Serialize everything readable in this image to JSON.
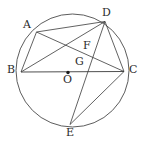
{
  "figure": {
    "name": "circle-with-inscribed-chords",
    "width": 147,
    "height": 146,
    "background_color": "#ffffff",
    "stroke_color": "#3a3a3a",
    "label_color": "#2b2b2b"
  },
  "circle": {
    "label": "circle-O",
    "center": {
      "x": 72.5,
      "y": 70.5
    },
    "radius": 56.5,
    "stroke_color": "#4a4a4a",
    "stroke_width": 0.9
  },
  "center_point": {
    "label": "O",
    "x": 68.0,
    "y": 72.5,
    "dot_radius": 1.7,
    "label_x": 63,
    "label_y": 74
  },
  "points": [
    {
      "id": "A",
      "label": "A",
      "x": 36.5,
      "y": 32.0,
      "label_x": 23,
      "label_y": 19,
      "on_circle": true
    },
    {
      "id": "B",
      "label": "B",
      "x": 21.0,
      "y": 72.0,
      "label_x": 7,
      "label_y": 64,
      "on_circle": true
    },
    {
      "id": "C",
      "label": "C",
      "x": 124.0,
      "y": 71.5,
      "label_x": 129,
      "label_y": 64,
      "on_circle": true
    },
    {
      "id": "D",
      "label": "D",
      "x": 105.0,
      "y": 21.5,
      "label_x": 102,
      "label_y": 7,
      "on_circle": true
    },
    {
      "id": "E",
      "label": "E",
      "x": 70.0,
      "y": 124.5,
      "label_x": 66,
      "label_y": 127,
      "on_circle": true
    },
    {
      "id": "F",
      "label": "F",
      "x": 82.0,
      "y": 51.5,
      "label_x": 83,
      "label_y": 40,
      "on_circle": false
    },
    {
      "id": "G",
      "label": "G",
      "x": 77.0,
      "y": 66.5,
      "label_x": 75,
      "label_y": 56,
      "on_circle": false
    }
  ],
  "segments": [
    {
      "id": "AB",
      "from": "A",
      "to": "B",
      "label": "chord-AB"
    },
    {
      "id": "AD",
      "from": "A",
      "to": "D",
      "label": "chord-AD"
    },
    {
      "id": "AC",
      "from": "A",
      "to": "C",
      "label": "chord-AC"
    },
    {
      "id": "BD",
      "from": "B",
      "to": "D",
      "label": "chord-BD"
    },
    {
      "id": "BC",
      "from": "B",
      "to": "C",
      "label": "diameter-BC"
    },
    {
      "id": "DC",
      "from": "D",
      "to": "C",
      "label": "chord-DC"
    },
    {
      "id": "DE",
      "from": "D",
      "to": "E",
      "label": "chord-DE"
    },
    {
      "id": "EC",
      "from": "E",
      "to": "C",
      "label": "chord-EC"
    }
  ],
  "intersections": [
    {
      "id": "F",
      "of": [
        "AC",
        "BD"
      ]
    },
    {
      "id": "G",
      "of": [
        "AC",
        "DE"
      ]
    }
  ]
}
